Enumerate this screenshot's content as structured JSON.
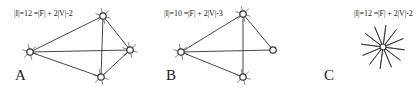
{
  "panels": [
    {
      "id": "A",
      "label": "A",
      "formula": "|I|=12 =|F| + 2|V|-2",
      "vertices": [
        [
          30,
          52
        ],
        [
          103,
          16
        ],
        [
          130,
          50
        ],
        [
          101,
          77
        ]
      ],
      "edges": [
        [
          0,
          1
        ],
        [
          0,
          2
        ],
        [
          0,
          3
        ],
        [
          1,
          2
        ],
        [
          1,
          3
        ],
        [
          2,
          3
        ]
      ],
      "stub_vertices": [
        0,
        1,
        2,
        3
      ]
    },
    {
      "id": "B",
      "label": "B",
      "formula": "|I|=10 =|F| + 2|V|-3",
      "vertices": [
        [
          181,
          52
        ],
        [
          243,
          14
        ],
        [
          273,
          50
        ],
        [
          243,
          77
        ]
      ],
      "edges": [
        [
          0,
          1
        ],
        [
          0,
          2
        ],
        [
          0,
          3
        ],
        [
          1,
          2
        ],
        [
          1,
          3
        ]
      ],
      "stub_vertices": [
        0,
        1,
        3
      ]
    },
    {
      "id": "C",
      "label": "C",
      "formula": "|I|=12 =|F| + 2|V|-2",
      "star": {
        "center": [
          383,
          47
        ],
        "rays": 12,
        "radius": 22
      }
    }
  ],
  "colors": {
    "line": "#333333",
    "text": "#222222",
    "background": "#ffffff"
  }
}
